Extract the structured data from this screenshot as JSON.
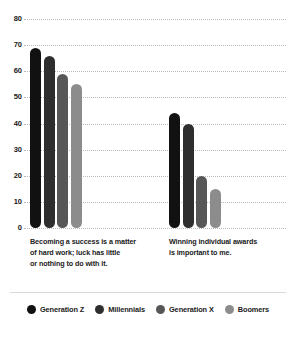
{
  "chart_data": {
    "type": "bar",
    "title": "",
    "subtitle": "",
    "xlabel": "",
    "ylabel": "",
    "ylim": [
      0,
      80
    ],
    "yticks": [
      0,
      10,
      20,
      30,
      40,
      50,
      60,
      70,
      80
    ],
    "grid": true,
    "legend_position": "bottom",
    "categories": [
      "Becoming a success is a matter of hard work; luck has little or nothing to do with it.",
      "Winning individual awards is important to me."
    ],
    "category_lines": [
      [
        "Becoming a success is a matter",
        "of hard work; luck has little",
        "or nothing to do with it."
      ],
      [
        "Winning individual awards",
        "is important to me."
      ]
    ],
    "series": [
      {
        "name": "Generation Z",
        "color": "#111111",
        "values": [
          69,
          44
        ]
      },
      {
        "name": "Millennials",
        "color": "#2e2e2e",
        "values": [
          66,
          40
        ]
      },
      {
        "name": "Generation X",
        "color": "#575757",
        "values": [
          59,
          20
        ]
      },
      {
        "name": "Boomers",
        "color": "#8c8c8c",
        "values": [
          55,
          15
        ]
      }
    ]
  },
  "legend": {
    "items": [
      {
        "label": "Generation Z",
        "color": "#111111"
      },
      {
        "label": "Millennials",
        "color": "#2e2e2e"
      },
      {
        "label": "Generation X",
        "color": "#575757"
      },
      {
        "label": "Boomers",
        "color": "#8c8c8c"
      }
    ]
  },
  "axis": {
    "y_tick_labels": [
      "80",
      "70",
      "60",
      "50",
      "40",
      "30",
      "20",
      "10",
      "0"
    ]
  }
}
